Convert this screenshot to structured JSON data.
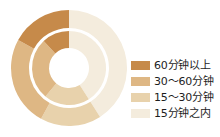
{
  "chart_data": {
    "type": "pie",
    "title": "",
    "subtitle": "",
    "xlabel": "",
    "ylabel": "",
    "variant": "nested-donut",
    "legend_position": "right",
    "grid": false,
    "categories": [
      "60分钟以上",
      "30～60分钟",
      "15～30分钟",
      "15分钟之内"
    ],
    "colors": [
      "#c68a4a",
      "#deb784",
      "#e8d2ac",
      "#f4ecdd"
    ],
    "series": [
      {
        "name": "外环",
        "ring": "outer",
        "values": [
          17,
          25,
          17,
          41
        ]
      },
      {
        "name": "内环",
        "ring": "inner",
        "values": [
          12,
          27,
          20,
          41
        ]
      }
    ]
  },
  "legend": {
    "items": [
      {
        "label": "60分钟以上",
        "color": "#c68a4a"
      },
      {
        "label": "30～60分钟",
        "color": "#deb784"
      },
      {
        "label": "15～30分钟",
        "color": "#e8d2ac"
      },
      {
        "label": "15分钟之内",
        "color": "#f4ecdd"
      }
    ]
  },
  "geometry": {
    "cx": 60,
    "cy": 65,
    "outer_r_outer": 58,
    "outer_r_inner": 40,
    "inner_r_outer": 37,
    "inner_r_inner": 20,
    "gap_color": "#ffffff"
  }
}
